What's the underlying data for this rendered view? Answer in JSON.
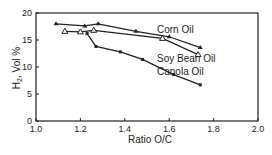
{
  "chart_data": {
    "type": "line",
    "title": "",
    "xlabel": "Ratio O/C",
    "ylabel": "H2, Vol %",
    "xlim": [
      1.0,
      2.0
    ],
    "ylim": [
      0,
      20
    ],
    "xticks": [
      "1.0",
      "1.2",
      "1.4",
      "1.6",
      "1.8",
      "2.0"
    ],
    "yticks": [
      "0",
      "5",
      "10",
      "15",
      "20"
    ],
    "grid": false,
    "legend": "inline labels",
    "series": [
      {
        "name": "Corn Oil",
        "marker": "filled-triangle",
        "x": [
          1.09,
          1.22,
          1.28,
          1.45,
          1.6,
          1.74
        ],
        "y": [
          18.0,
          17.6,
          18.0,
          16.6,
          15.6,
          13.6
        ]
      },
      {
        "name": "Soy Bean Oil",
        "marker": "open-triangle",
        "x": [
          1.13,
          1.2,
          1.26,
          1.57,
          1.73
        ],
        "y": [
          16.6,
          16.5,
          16.8,
          15.3,
          12.3
        ]
      },
      {
        "name": "Canola Oil",
        "marker": "filled-square",
        "x": [
          1.23,
          1.27,
          1.38,
          1.48,
          1.62,
          1.74
        ],
        "y": [
          16.2,
          13.8,
          12.8,
          11.4,
          8.6,
          6.7
        ]
      }
    ]
  },
  "labels": {
    "corn": "Corn Oil",
    "soy": "Soy Bean Oil",
    "canola": "Canola Oil",
    "xlabel": "Ratio O/C",
    "ylabel_main": "H",
    "ylabel_sub": "2",
    "ylabel_rest": ", Vol %"
  }
}
